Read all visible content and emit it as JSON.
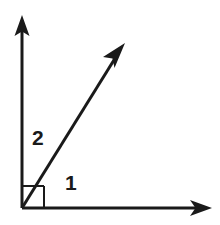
{
  "figure": {
    "type": "geometry-diagram",
    "background_color": "#ffffff",
    "stroke_color": "#1a1a1a",
    "stroke_width": 3,
    "vertex": {
      "x": 22,
      "y": 208
    },
    "right_angle_marker": {
      "name": "right-angle-square",
      "size": 22,
      "stroke_width": 2
    },
    "rays": [
      {
        "name": "vertical-ray",
        "from": {
          "x": 22,
          "y": 208
        },
        "to": {
          "x": 22,
          "y": 16
        },
        "arrowhead": "solid-triangle"
      },
      {
        "name": "horizontal-ray",
        "from": {
          "x": 22,
          "y": 208
        },
        "to": {
          "x": 211,
          "y": 208
        },
        "arrowhead": "solid-triangle"
      },
      {
        "name": "diagonal-ray",
        "from": {
          "x": 22,
          "y": 208
        },
        "to": {
          "x": 124,
          "y": 44
        },
        "arrowhead": "barbed"
      }
    ],
    "labels": [
      {
        "name": "angle-label-2",
        "text": "2",
        "x": 32,
        "y": 127,
        "describes": "angle between vertical ray and diagonal ray"
      },
      {
        "name": "angle-label-1",
        "text": "1",
        "x": 65,
        "y": 172,
        "describes": "angle between diagonal ray and horizontal ray"
      }
    ]
  }
}
